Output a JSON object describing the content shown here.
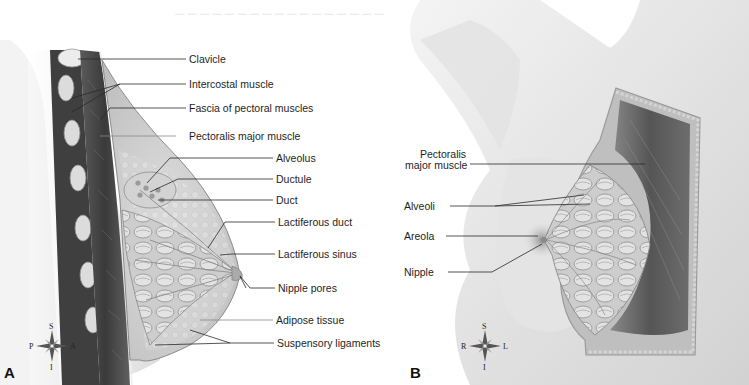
{
  "figure": {
    "panels": [
      {
        "id": "A",
        "letter": "A",
        "view": "sagittal section",
        "labels": [
          {
            "text": "Clavicle",
            "x": 189,
            "y": 55
          },
          {
            "text": "Intercostal muscle",
            "x": 189,
            "y": 79
          },
          {
            "text": "Fascia of pectoral muscles",
            "x": 189,
            "y": 103
          },
          {
            "text": "Pectoralis major muscle",
            "x": 189,
            "y": 130
          },
          {
            "text": "Alveolus",
            "x": 276,
            "y": 153
          },
          {
            "text": "Ductule",
            "x": 276,
            "y": 174
          },
          {
            "text": "Duct",
            "x": 276,
            "y": 195
          },
          {
            "text": "Lactiferous duct",
            "x": 278,
            "y": 216
          },
          {
            "text": "Lactiferous sinus",
            "x": 278,
            "y": 249
          },
          {
            "text": "Nipple pores",
            "x": 278,
            "y": 283
          },
          {
            "text": "Adipose tissue",
            "x": 276,
            "y": 316
          },
          {
            "text": "Suspensory ligaments",
            "x": 277,
            "y": 338
          }
        ],
        "compass": {
          "top": "S",
          "bottom": "I",
          "left": "P",
          "right": "A"
        }
      },
      {
        "id": "B",
        "letter": "B",
        "view": "anterior view with cutaway",
        "labels": [
          {
            "text": "Pectoralis",
            "x": 420,
            "y": 150
          },
          {
            "text": "major muscle",
            "x": 406,
            "y": 162
          },
          {
            "text": "Alveoli",
            "x": 404,
            "y": 201
          },
          {
            "text": "Areola",
            "x": 404,
            "y": 232
          },
          {
            "text": "Nipple",
            "x": 404,
            "y": 267
          }
        ],
        "compass": {
          "top": "S",
          "bottom": "I",
          "left": "R",
          "right": "L"
        }
      }
    ]
  },
  "colors": {
    "background": "#ffffff",
    "label_text": "#1e1e1e",
    "leader_line": "#2a2a2a",
    "skin_light": "#ececec",
    "skin_shadow": "#bdbdbd",
    "muscle_dark": "#4a4a4a",
    "glandular": "#c9c9c9",
    "bone": "#e4e4e4"
  }
}
